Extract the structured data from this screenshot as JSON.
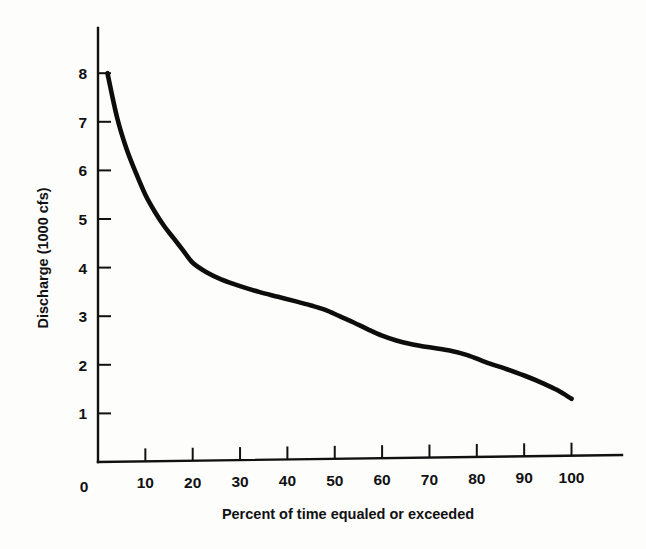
{
  "chart_data": {
    "type": "line",
    "title": "",
    "xlabel": "Percent of time equaled or exceeded",
    "ylabel": "Discharge (1000 cfs)",
    "xlim": [
      0,
      115
    ],
    "ylim": [
      0,
      8.6
    ],
    "grid": false,
    "legend": false,
    "x_ticks": [
      10,
      20,
      30,
      40,
      50,
      60,
      70,
      80,
      90,
      100
    ],
    "x_tick_labels": [
      "10",
      "20",
      "30",
      "40",
      "50",
      "60",
      "70",
      "80",
      "90",
      "100"
    ],
    "origin_label": "0",
    "y_ticks": [
      1,
      2,
      3,
      4,
      5,
      6,
      7,
      8
    ],
    "y_tick_labels": [
      "1",
      "2",
      "3",
      "4",
      "5",
      "6",
      "7",
      "8"
    ],
    "series": [
      {
        "name": "Flow duration curve",
        "color": "#0d0d0d",
        "x": [
          2,
          4,
          6,
          8,
          10,
          12,
          14,
          16,
          18,
          20,
          23,
          26,
          30,
          34,
          38,
          42,
          45,
          48,
          51,
          54,
          57,
          60,
          63,
          66,
          70,
          74,
          78,
          82,
          86,
          90,
          94,
          97,
          100
        ],
        "y": [
          8.0,
          7.1,
          6.45,
          5.95,
          5.5,
          5.15,
          4.85,
          4.6,
          4.35,
          4.1,
          3.9,
          3.76,
          3.62,
          3.5,
          3.4,
          3.3,
          3.22,
          3.13,
          3.0,
          2.87,
          2.73,
          2.6,
          2.5,
          2.43,
          2.36,
          2.3,
          2.2,
          2.05,
          1.92,
          1.78,
          1.62,
          1.48,
          1.3
        ]
      }
    ],
    "annotations": []
  },
  "axes": {
    "y_axis_name": "y-axis",
    "x_axis_name": "x-axis"
  },
  "colors": {
    "curve": "#0d0d0d",
    "axis": "#111111",
    "background": "#fdfdfc"
  }
}
